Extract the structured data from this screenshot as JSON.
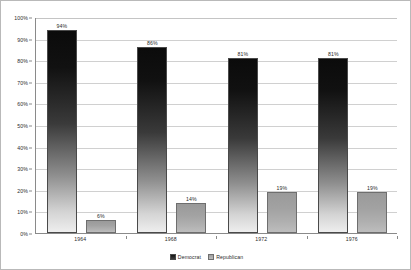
{
  "chart_data": {
    "type": "bar",
    "title": "",
    "xlabel": "",
    "ylabel": "",
    "categories": [
      "1964",
      "1968",
      "1972",
      "1976"
    ],
    "series": [
      {
        "name": "Democrat",
        "color": "#1a1a1a",
        "values": [
          94,
          86,
          81,
          81
        ],
        "labels": [
          "94%",
          "86%",
          "81%",
          "81%"
        ]
      },
      {
        "name": "Republican",
        "color": "#a8a8a8",
        "values": [
          6,
          14,
          19,
          19
        ],
        "labels": [
          "6%",
          "14%",
          "19%",
          "19%"
        ]
      }
    ],
    "ylim": [
      0,
      100
    ],
    "y_ticks": [
      0,
      10,
      20,
      30,
      40,
      50,
      60,
      70,
      80,
      90,
      100
    ],
    "y_tick_labels": [
      "0%",
      "10%",
      "20%",
      "30%",
      "40%",
      "50%",
      "60%",
      "70%",
      "80%",
      "90%",
      "100%"
    ],
    "grid": true,
    "legend_position": "bottom-center"
  },
  "legend": {
    "entries": [
      {
        "label": "Democrat"
      },
      {
        "label": "Republican"
      }
    ]
  }
}
